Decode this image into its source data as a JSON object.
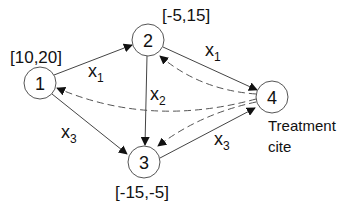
{
  "diagram": {
    "nodes": [
      {
        "id": "1",
        "label": "1",
        "range": "[10,20]",
        "cx": 40,
        "cy": 83
      },
      {
        "id": "2",
        "label": "2",
        "range": "[-5,15]",
        "cx": 148,
        "cy": 40
      },
      {
        "id": "3",
        "label": "3",
        "range": "[-15,-5]",
        "cx": 144,
        "cy": 162
      },
      {
        "id": "4",
        "label": "4",
        "range": "",
        "cx": 272,
        "cy": 97
      }
    ],
    "edges_solid": [
      {
        "from": "1",
        "to": "2",
        "label": "x",
        "sub": "1"
      },
      {
        "from": "2",
        "to": "4",
        "label": "x",
        "sub": "1"
      },
      {
        "from": "2",
        "to": "3",
        "label": "x",
        "sub": "2"
      },
      {
        "from": "1",
        "to": "3",
        "label": "x",
        "sub": "3"
      },
      {
        "from": "3",
        "to": "4",
        "label": "x",
        "sub": "3"
      }
    ],
    "edges_dashed": [
      {
        "from": "4",
        "to": "2"
      },
      {
        "from": "4",
        "to": "1"
      },
      {
        "from": "4",
        "to": "3"
      }
    ],
    "node4_note_line1": "Treatment",
    "node4_note_line2": "cite",
    "colors": {
      "line": "#444444",
      "text": "#111111",
      "background": "#ffffff"
    }
  }
}
